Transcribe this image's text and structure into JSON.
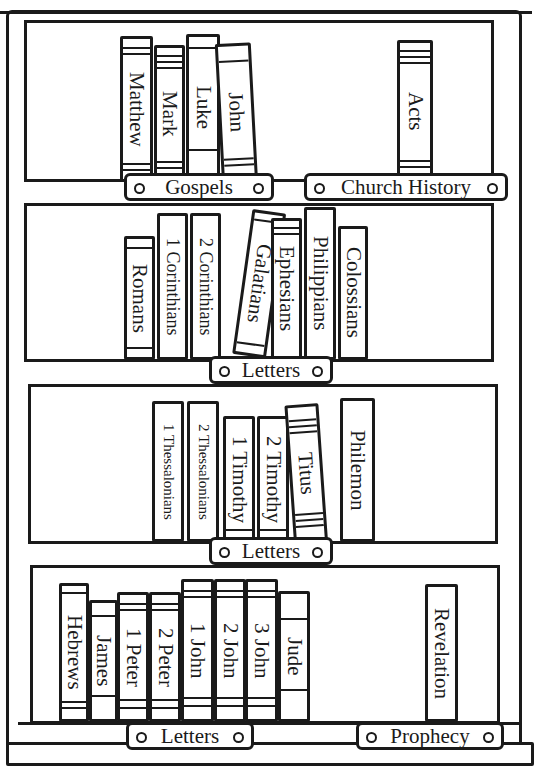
{
  "bookcase": {
    "shelves": [
      {
        "books": [
          {
            "title": "Matthew"
          },
          {
            "title": "Mark"
          },
          {
            "title": "Luke"
          },
          {
            "title": "John"
          },
          {
            "title": "Acts"
          }
        ],
        "labels": [
          "Gospels",
          "Church History"
        ]
      },
      {
        "books": [
          {
            "title": "Romans"
          },
          {
            "title": "1 Corinthians"
          },
          {
            "title": "2 Corinthians"
          },
          {
            "title": "Galatians"
          },
          {
            "title": "Ephesians"
          },
          {
            "title": "Philippians"
          },
          {
            "title": "Colossians"
          }
        ],
        "labels": [
          "Letters"
        ]
      },
      {
        "books": [
          {
            "title": "1 Thessalonians"
          },
          {
            "title": "2 Thessalonians"
          },
          {
            "title": "1 Timothy"
          },
          {
            "title": "2 Timothy"
          },
          {
            "title": "Titus"
          },
          {
            "title": "Philemon"
          }
        ],
        "labels": [
          "Letters"
        ]
      },
      {
        "books": [
          {
            "title": "Hebrews"
          },
          {
            "title": "James"
          },
          {
            "title": "1 Peter"
          },
          {
            "title": "2 Peter"
          },
          {
            "title": "1 John"
          },
          {
            "title": "2 John"
          },
          {
            "title": "3 John"
          },
          {
            "title": "Jude"
          },
          {
            "title": "Revelation"
          }
        ],
        "labels": [
          "Letters",
          "Prophecy"
        ]
      }
    ]
  }
}
